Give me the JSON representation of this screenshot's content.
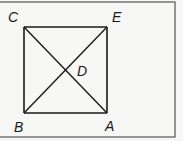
{
  "diagram": {
    "type": "geometry-figure",
    "colors": {
      "background": "#f7f7f5",
      "line": "#1a1a1a",
      "frame": "#555555"
    },
    "points": [
      {
        "label": "C",
        "role": "top-left vertex",
        "x": 24,
        "y": 27
      },
      {
        "label": "E",
        "role": "top-right vertex",
        "x": 107,
        "y": 27
      },
      {
        "label": "B",
        "role": "bottom-left vertex",
        "x": 24,
        "y": 113
      },
      {
        "label": "A",
        "role": "bottom-right vertex",
        "x": 107,
        "y": 113
      },
      {
        "label": "D",
        "role": "intersection of diagonals",
        "x": 66,
        "y": 70
      }
    ],
    "segments": [
      "CE",
      "EA",
      "AB",
      "BC",
      "CA",
      "BE"
    ],
    "labels": {
      "C": "C",
      "E": "E",
      "D": "D",
      "B": "B",
      "A": "A"
    }
  }
}
